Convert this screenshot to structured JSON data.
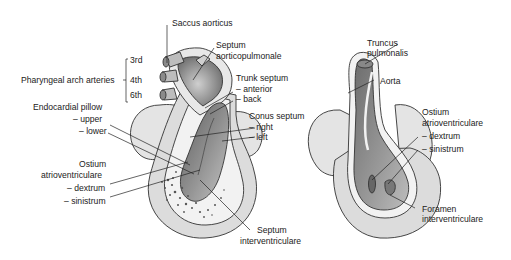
{
  "figure": {
    "left_heart": {
      "labels": {
        "saccus_aorticus": "Saccus aorticus",
        "septum_ap_1": "Septum",
        "septum_ap_2": "aorticopulmonale",
        "arch_3rd": "3rd",
        "arch_4th": "4th",
        "arch_6th": "6th",
        "pharyngeal": "Pharyngeal arch arteries",
        "trunk_septum": "Trunk septum",
        "trunk_anterior": "– anterior",
        "trunk_back": "– back",
        "endocardial": "Endocardial pillow",
        "endo_upper": "– upper",
        "endo_lower": "– lower",
        "conus_septum": "Conus septum",
        "conus_right": "– right",
        "conus_left": "– left",
        "ostium_1": "Ostium",
        "ostium_2": "atrioventriculare",
        "ostium_dextrum": "– dextrum",
        "ostium_sinistrum": "– sinistrum",
        "septum_iv_1": "Septum",
        "septum_iv_2": "interventriculare"
      }
    },
    "right_heart": {
      "labels": {
        "truncus_1": "Truncus",
        "truncus_2": "pulmonalis",
        "aorta": "Aorta",
        "ostium_1": "Ostium",
        "ostium_2": "atrioventriculare",
        "ostium_dextrum": "– dextrum",
        "ostium_sinistrum": "– sinistrum",
        "foramen_1": "Foramen",
        "foramen_2": "interventriculare"
      }
    },
    "colors": {
      "atrium_fill": "#e4e4e4",
      "wall_fill": "#d6d6d6",
      "lumen_dark": "#7a7a7a",
      "lumen_mid": "#a8a8a8",
      "outline": "#333333"
    }
  }
}
